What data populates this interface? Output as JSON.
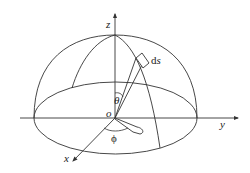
{
  "diagram": {
    "labels": {
      "z_axis": "z",
      "y_axis": "y",
      "x_axis": "x",
      "origin": "o",
      "theta": "θ",
      "phi": "ϕ",
      "area_element_d": "d",
      "area_element_s": "s"
    },
    "colors": {
      "line": "#333333",
      "background": "#ffffff"
    }
  }
}
